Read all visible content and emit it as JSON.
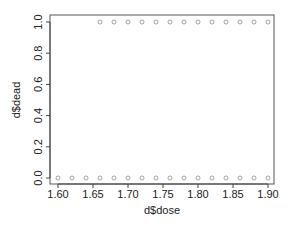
{
  "chart_data": {
    "type": "scatter",
    "title": "",
    "xlabel": "d$dose",
    "ylabel": "d$dead",
    "xlim": [
      1.59,
      1.91
    ],
    "ylim": [
      -0.04,
      1.04
    ],
    "grid": false,
    "legend": null,
    "x_ticks": [
      1.6,
      1.65,
      1.7,
      1.75,
      1.8,
      1.85,
      1.9
    ],
    "x_tick_labels": [
      "1.60",
      "1.65",
      "1.70",
      "1.75",
      "1.80",
      "1.85",
      "1.90"
    ],
    "y_ticks": [
      0.0,
      0.2,
      0.4,
      0.6,
      0.8,
      1.0
    ],
    "y_tick_labels": [
      "0.0",
      "0.2",
      "0.4",
      "0.6",
      "0.8",
      "1.0"
    ],
    "series": [
      {
        "name": "dead=0",
        "x": [
          1.6,
          1.62,
          1.64,
          1.66,
          1.68,
          1.7,
          1.72,
          1.74,
          1.76,
          1.78,
          1.8,
          1.82,
          1.84,
          1.86,
          1.88,
          1.9
        ],
        "y": [
          0,
          0,
          0,
          0,
          0,
          0,
          0,
          0,
          0,
          0,
          0,
          0,
          0,
          0,
          0,
          0
        ]
      },
      {
        "name": "dead=1",
        "x": [
          1.66,
          1.68,
          1.7,
          1.72,
          1.74,
          1.76,
          1.78,
          1.8,
          1.82,
          1.84,
          1.86,
          1.88,
          1.9
        ],
        "y": [
          1,
          1,
          1,
          1,
          1,
          1,
          1,
          1,
          1,
          1,
          1,
          1,
          1
        ]
      }
    ],
    "marker": "open-circle",
    "marker_color": "#8a8a8a",
    "axis_color": "#444444"
  }
}
